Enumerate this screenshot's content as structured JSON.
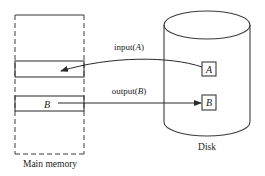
{
  "diagram": {
    "main_memory": {
      "label": "Main memory",
      "slots": [
        {
          "id": "slot-1",
          "content": ""
        },
        {
          "id": "slot-2",
          "content": "B"
        }
      ]
    },
    "disk": {
      "label": "Disk",
      "blocks": [
        {
          "id": "disk-block-a",
          "content": "A"
        },
        {
          "id": "disk-block-b",
          "content": "B"
        }
      ]
    },
    "operations": {
      "input": {
        "label_prefix": "input(",
        "arg": "A",
        "label_suffix": ")"
      },
      "output": {
        "label_prefix": "output(",
        "arg": "B",
        "label_suffix": ")"
      }
    },
    "colors": {
      "stroke": "#3a3a3a",
      "text": "#1a1a1a",
      "background": "#ffffff"
    }
  }
}
